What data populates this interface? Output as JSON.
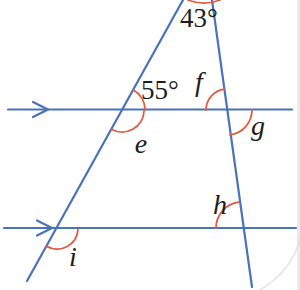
{
  "figure": {
    "width": 300,
    "height": 290,
    "colors": {
      "line_blue": "#4a72b8",
      "arc_red": "#e25b44",
      "text_black": "#1d1d1b",
      "page_edge_gray": "#d9d9d9"
    },
    "parallel_lines": [
      {
        "name": "upper-parallel-line",
        "x1": 8,
        "y": 109.5,
        "x2": 292
      },
      {
        "name": "lower-parallel-line",
        "x1": 4,
        "y": 228,
        "x2": 296
      }
    ],
    "direction_arrows": [
      {
        "name": "direction-arrow-upper",
        "tip_x": 48,
        "y": 109.5,
        "back": 15,
        "spread": 7.5
      },
      {
        "name": "direction-arrow-lower",
        "tip_x": 52,
        "y": 228,
        "back": 15,
        "spread": 7.5
      }
    ],
    "transversals": [
      {
        "name": "left-transversal-line",
        "x1": 183,
        "y1": 0,
        "x2": 27,
        "y2": 281
      },
      {
        "name": "right-transversal-line",
        "x1": 212,
        "y1": 0,
        "x2": 252,
        "y2": 287
      }
    ],
    "angle_arcs": [
      {
        "name": "angle-arc-43",
        "cx": 204,
        "cy": -42,
        "r": 45,
        "a1": 69,
        "a2": 111
      },
      {
        "name": "angle-arc-55",
        "cx": 122,
        "cy": 110,
        "r": 23,
        "a1": -61,
        "a2": 0
      },
      {
        "name": "angle-arc-e",
        "cx": 122,
        "cy": 110,
        "r": 22,
        "a1": 3,
        "a2": 119
      },
      {
        "name": "angle-arc-f",
        "cx": 227,
        "cy": 110,
        "r": 21,
        "a1": 180,
        "a2": 263
      },
      {
        "name": "angle-arc-g",
        "cx": 227,
        "cy": 110,
        "r": 25,
        "a1": 0,
        "a2": 83
      },
      {
        "name": "angle-arc-h",
        "cx": 242,
        "cy": 228,
        "r": 26,
        "a1": 180,
        "a2": 263
      },
      {
        "name": "angle-arc-i",
        "cx": 57,
        "cy": 228,
        "r": 21,
        "a1": 3,
        "a2": 119
      }
    ],
    "angle_labels": [
      {
        "name": "angle-label-43",
        "text": "43°",
        "x": 199,
        "y": 27,
        "italic": false,
        "size": 27
      },
      {
        "name": "angle-label-55",
        "text": "55°",
        "x": 160,
        "y": 99,
        "italic": false,
        "size": 27
      },
      {
        "name": "angle-label-f",
        "text": "f",
        "x": 199,
        "y": 91,
        "italic": true,
        "size": 28
      },
      {
        "name": "angle-label-e",
        "text": "e",
        "x": 141,
        "y": 153,
        "italic": true,
        "size": 28
      },
      {
        "name": "angle-label-g",
        "text": "g",
        "x": 258,
        "y": 135,
        "italic": true,
        "size": 28
      },
      {
        "name": "angle-label-h",
        "text": "h",
        "x": 220,
        "y": 214,
        "italic": true,
        "size": 28
      },
      {
        "name": "angle-label-i",
        "text": "i",
        "x": 73,
        "y": 266,
        "italic": true,
        "size": 28
      }
    ],
    "stroke": {
      "line_width": 2.2,
      "arc_width": 1.8
    }
  }
}
